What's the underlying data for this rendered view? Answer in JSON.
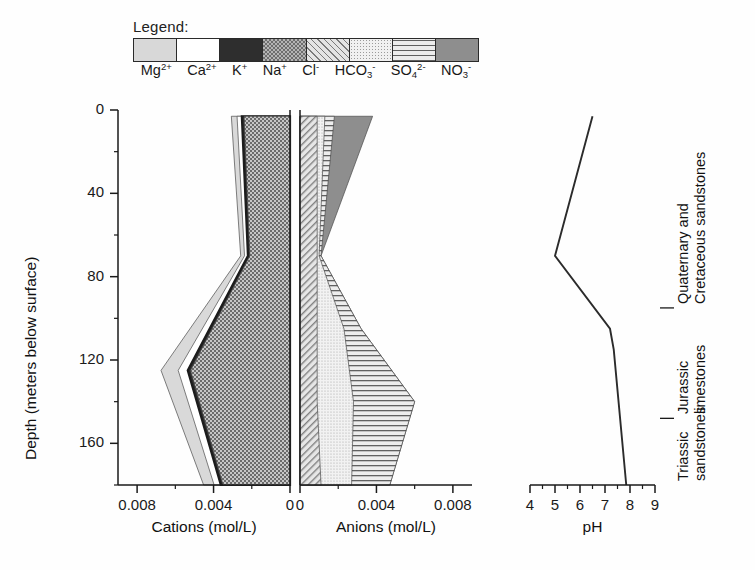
{
  "legend": {
    "title": "Legend:",
    "items": [
      {
        "name": "Mg",
        "charge": "2+",
        "sub": "",
        "pattern": "fill-mg",
        "key": "Mg2+"
      },
      {
        "name": "Ca",
        "charge": "2+",
        "sub": "",
        "pattern": "fill-ca",
        "key": "Ca2+"
      },
      {
        "name": "K",
        "charge": "+",
        "sub": "",
        "pattern": "fill-k",
        "key": "K+"
      },
      {
        "name": "Na",
        "charge": "+",
        "sub": "",
        "pattern": "fill-na",
        "key": "Na+"
      },
      {
        "name": "Cl",
        "charge": "-",
        "sub": "",
        "pattern": "fill-cl",
        "key": "Cl-"
      },
      {
        "name": "HCO",
        "charge": "-",
        "sub": "3",
        "pattern": "fill-hco3",
        "key": "HCO3-"
      },
      {
        "name": "SO",
        "charge": "2-",
        "sub": "4",
        "pattern": "fill-so4",
        "key": "SO42-"
      },
      {
        "name": "NO",
        "charge": "-",
        "sub": "3",
        "pattern": "fill-no3",
        "key": "NO3-"
      }
    ]
  },
  "axes": {
    "depth_title": "Depth (meters below surface)",
    "depth_ticks": [
      "0",
      "40",
      "80",
      "120",
      "160"
    ],
    "depth_tick_values": [
      0,
      40,
      80,
      120,
      160
    ],
    "depth_minor_step": 20,
    "depth_range": [
      0,
      180
    ],
    "cations_title": "Cations (mol/L)",
    "cations_ticks": [
      "0.008",
      "0.004",
      "0"
    ],
    "cations_tick_values": [
      0.008,
      0.004,
      0
    ],
    "anions_title": "Anions (mol/L)",
    "anions_ticks": [
      "0",
      "0.004",
      "0.008"
    ],
    "anions_tick_values": [
      0,
      0.004,
      0.008
    ],
    "concentration_range": [
      0,
      0.009
    ],
    "ph_title": "pH",
    "ph_ticks": [
      "4",
      "5",
      "6",
      "7",
      "8",
      "9"
    ],
    "ph_tick_values": [
      4,
      5,
      6,
      7,
      8,
      9
    ],
    "ph_range": [
      4,
      9
    ]
  },
  "geology": [
    {
      "line1": "Quaternary and",
      "line2": "Cretaceous sandstones",
      "top_depth": 0,
      "bottom_depth": 95
    },
    {
      "line1": "Jurassic",
      "line2": "limestones",
      "top_depth": 95,
      "bottom_depth": 148
    },
    {
      "line1": "Triassic",
      "line2": "sandstones",
      "top_depth": 148,
      "bottom_depth": 180
    }
  ],
  "colors": {
    "axis": "#1a1a1a",
    "ph_line": "#2b2b2b",
    "k_outline": "#1c1c1c",
    "mg": "#d8d8d8",
    "ca": "#ffffff",
    "k": "#2e2e2e",
    "na": "#9a9a9a",
    "cl": "#c8c8c8",
    "hco3": "#efefef",
    "so4": "#dcdcdc",
    "no3": "#8e8e8e"
  },
  "chart_data": {
    "type": "area",
    "title": "",
    "orientation": "vertical-depth",
    "panels": [
      {
        "name": "cations",
        "xlabel": "Cations (mol/L)",
        "ylabel": "Depth (meters below surface)",
        "xlim": [
          0,
          0.009
        ],
        "x_reversed": true,
        "ylim": [
          0,
          180
        ],
        "y_inverted": true,
        "stacked": true,
        "depths": [
          3,
          70,
          125,
          180
        ],
        "series": [
          {
            "name": "Na+",
            "pattern": "crosshatch",
            "values": [
              0.0024,
              0.0021,
              0.0052,
              0.0035
            ]
          },
          {
            "name": "K+",
            "pattern": "solid-dark",
            "values": [
              0.00012,
              0.0001,
              0.00015,
              0.00012
            ]
          },
          {
            "name": "Ca2+",
            "pattern": "white",
            "values": [
              0.00025,
              0.00018,
              0.0005,
              0.00035
            ]
          },
          {
            "name": "Mg2+",
            "pattern": "light-gray",
            "values": [
              0.0003,
              0.0002,
              0.0009,
              0.00055
            ]
          }
        ],
        "cumulative_totals": [
          0.00307,
          0.00258,
          0.00725,
          0.00452
        ]
      },
      {
        "name": "anions",
        "xlabel": "Anions (mol/L)",
        "xlim": [
          0,
          0.009
        ],
        "x_reversed": false,
        "ylim": [
          0,
          180
        ],
        "y_inverted": true,
        "stacked": true,
        "depths": [
          3,
          70,
          105,
          140,
          180
        ],
        "series": [
          {
            "name": "Cl-",
            "pattern": "diagonal-hatch",
            "values": [
              0.0009,
              0.0009,
              0.0009,
              0.0009,
              0.0011
            ]
          },
          {
            "name": "HCO3-",
            "pattern": "stipple",
            "values": [
              0.0004,
              0.0001,
              0.0014,
              0.0019,
              0.0016
            ]
          },
          {
            "name": "SO42-",
            "pattern": "horizontal-line",
            "values": [
              0.0005,
              0.0001,
              0.0009,
              0.0032,
              0.002
            ]
          },
          {
            "name": "NO3-",
            "pattern": "dark-gray",
            "values": [
              0.002,
              0.0,
              0.0,
              0.0,
              0.0
            ]
          }
        ],
        "cumulative_totals": [
          0.0038,
          0.0011,
          0.0032,
          0.006,
          0.0047
        ]
      },
      {
        "name": "ph",
        "type": "line",
        "xlabel": "pH",
        "xlim": [
          4,
          9
        ],
        "ylim": [
          0,
          180
        ],
        "y_inverted": true,
        "x": [
          6.5,
          5.0,
          7.2,
          7.35,
          7.85
        ],
        "depths": [
          3,
          70,
          105,
          115,
          180
        ]
      }
    ]
  }
}
